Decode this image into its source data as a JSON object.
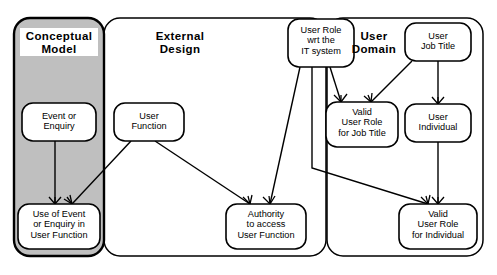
{
  "diagram": {
    "type": "entity-relationship",
    "notation": "crow's foot",
    "colors": {
      "stroke": "#000000",
      "background": "#ffffff",
      "conceptual_model_fill": "#bfbfbf",
      "entity_fill": "#ffffff",
      "label_fill": "#ffffff"
    },
    "regions": [
      {
        "id": "conceptual-model",
        "label": "Conceptual\nModel",
        "label_line1": "Conceptual",
        "label_line2": "Model",
        "shaded": true,
        "x": 14,
        "y": 18,
        "w": 90,
        "h": 238
      },
      {
        "id": "external-design",
        "label": "External\nDesign",
        "label_line1": "External",
        "label_line2": "Design",
        "shaded": false,
        "x": 104,
        "y": 18,
        "w": 222,
        "h": 238
      },
      {
        "id": "user-domain",
        "label": "User\nDomain",
        "label_line1": "User",
        "label_line2": "Domain",
        "shaded": false,
        "x": 327,
        "y": 18,
        "w": 156,
        "h": 238
      }
    ],
    "entities": [
      {
        "id": "event-or-enquiry",
        "lines": [
          "Event or",
          "Enquiry"
        ],
        "region": "conceptual-model",
        "x": 22,
        "y": 103,
        "w": 74,
        "h": 38
      },
      {
        "id": "use-of-event-or-enquiry-in-user-function",
        "lines": [
          "Use of Event",
          "or Enquiry in",
          "User Function"
        ],
        "region": "conceptual-model",
        "x": 18,
        "y": 204,
        "w": 82,
        "h": 45
      },
      {
        "id": "user-function",
        "lines": [
          "User",
          "Function"
        ],
        "region": "external-design",
        "x": 114,
        "y": 103,
        "w": 70,
        "h": 38
      },
      {
        "id": "authority-to-access-user-function",
        "lines": [
          "Authority",
          "to access",
          "User Function"
        ],
        "region": "external-design",
        "x": 226,
        "y": 204,
        "w": 80,
        "h": 45
      },
      {
        "id": "user-role-wrt-the-it-system",
        "lines": [
          "User Role",
          "wrt the",
          "IT system"
        ],
        "region": "external-design",
        "x": 288,
        "y": 19,
        "w": 66,
        "h": 48
      },
      {
        "id": "valid-user-role-for-job-title",
        "lines": [
          "Valid",
          "User Role",
          "for Job Title"
        ],
        "region": "user-domain",
        "x": 326,
        "y": 102,
        "w": 72,
        "h": 45
      },
      {
        "id": "user-job-title",
        "lines": [
          "User",
          "Job Title"
        ],
        "region": "user-domain",
        "x": 405,
        "y": 23,
        "w": 66,
        "h": 38
      },
      {
        "id": "user-individual",
        "lines": [
          "User",
          "Individual"
        ],
        "region": "user-domain",
        "x": 405,
        "y": 104,
        "w": 66,
        "h": 38
      },
      {
        "id": "valid-user-role-for-individual",
        "lines": [
          "Valid",
          "User Role",
          "for Individual"
        ],
        "region": "user-domain",
        "x": 399,
        "y": 204,
        "w": 78,
        "h": 45
      }
    ],
    "relationships": [
      {
        "id": "rel-event-to-use",
        "from": "event-or-enquiry",
        "to": "use-of-event-or-enquiry-in-user-function",
        "many_end": "to"
      },
      {
        "id": "rel-userfunction-to-use",
        "from": "user-function",
        "to": "use-of-event-or-enquiry-in-user-function",
        "many_end": "to"
      },
      {
        "id": "rel-userfunction-to-authority",
        "from": "user-function",
        "to": "authority-to-access-user-function",
        "many_end": "to"
      },
      {
        "id": "rel-userrole-to-authority",
        "from": "user-role-wrt-the-it-system",
        "to": "authority-to-access-user-function",
        "many_end": "to"
      },
      {
        "id": "rel-userrole-to-validjobtitle",
        "from": "user-role-wrt-the-it-system",
        "to": "valid-user-role-for-job-title",
        "many_end": "to"
      },
      {
        "id": "rel-userrole-to-validindividual",
        "from": "user-role-wrt-the-it-system",
        "to": "valid-user-role-for-individual",
        "many_end": "to"
      },
      {
        "id": "rel-jobtitle-to-validjobtitle",
        "from": "user-job-title",
        "to": "valid-user-role-for-job-title",
        "many_end": "to"
      },
      {
        "id": "rel-jobtitle-to-individual",
        "from": "user-job-title",
        "to": "user-individual",
        "many_end": "to"
      },
      {
        "id": "rel-individual-to-validindividual",
        "from": "user-individual",
        "to": "valid-user-role-for-individual",
        "many_end": "to"
      }
    ]
  }
}
